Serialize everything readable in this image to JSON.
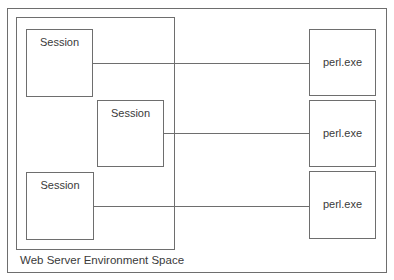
{
  "diagram": {
    "outer_frame": {},
    "environment": {
      "label": "Web Server Environment Space"
    },
    "sessions": [
      {
        "label": "Session"
      },
      {
        "label": "Session"
      },
      {
        "label": "Session"
      }
    ],
    "processes": [
      {
        "label": "perl.exe"
      },
      {
        "label": "perl.exe"
      },
      {
        "label": "perl.exe"
      }
    ],
    "connections": [
      {
        "from": "Session",
        "to": "perl.exe"
      },
      {
        "from": "Session",
        "to": "perl.exe"
      },
      {
        "from": "Session",
        "to": "perl.exe"
      }
    ],
    "colors": {
      "stroke": "#6e6e6e",
      "text": "#3a3a3a",
      "background": "#ffffff"
    }
  }
}
